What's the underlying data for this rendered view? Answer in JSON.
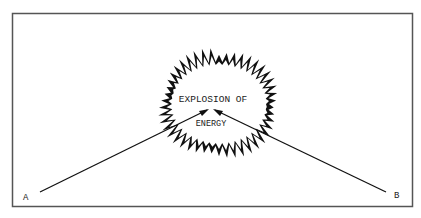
{
  "diagram": {
    "center_text_line1": "EXPLOSION OF",
    "center_text_line2": "ENERGY",
    "point_a_label": "A",
    "point_b_label": "B",
    "colors": {
      "ink": "#111111",
      "frame": "#555555",
      "background": "#ffffff"
    }
  }
}
